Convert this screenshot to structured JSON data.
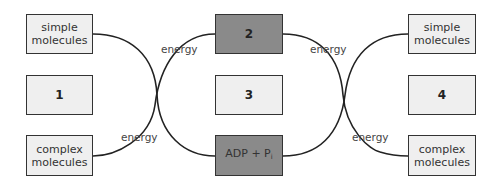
{
  "diagram": {
    "left": {
      "top_box": "simple molecules",
      "middle_box": "1",
      "bottom_box": "complex molecules",
      "energy_label": "energy"
    },
    "center": {
      "top_box": "2",
      "middle_box": "3",
      "bottom_box_main": "ADP + P",
      "bottom_box_sub": "i",
      "energy_label_left": "energy",
      "energy_label_right": "energy"
    },
    "right": {
      "top_box": "simple molecules",
      "middle_box": "4",
      "bottom_box": "complex molecules",
      "energy_label": "energy"
    },
    "colors": {
      "light_box": "#efefef",
      "dark_box": "#8a8a8a",
      "line": "#222222"
    }
  }
}
